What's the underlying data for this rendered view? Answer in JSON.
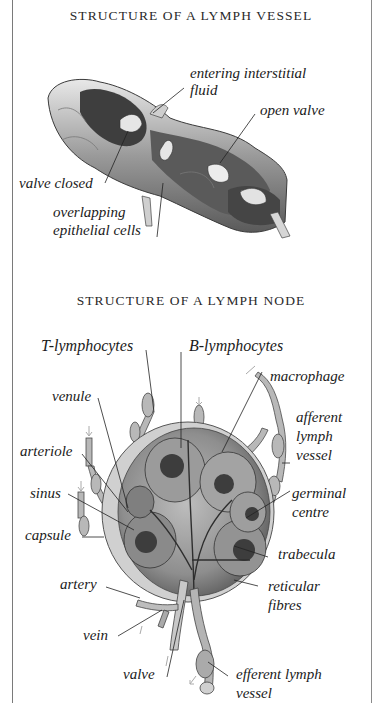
{
  "vessel_section": {
    "title": "STRUCTURE OF A LYMPH VESSEL",
    "labels": {
      "entering_line1": "entering interstitial",
      "entering_line2": "fluid",
      "open_valve": "open valve",
      "valve_closed": "valve closed",
      "overlapping_line1": "overlapping",
      "overlapping_line2": "epithelial cells"
    }
  },
  "node_section": {
    "title": "STRUCTURE OF A LYMPH NODE",
    "labels": {
      "t_lymphocytes": "T-lymphocytes",
      "b_lymphocytes": "B-lymphocytes",
      "macrophage": "macrophage",
      "venule": "venule",
      "afferent_line1": "afferent",
      "afferent_line2": "lymph",
      "afferent_line3": "vessel",
      "arteriole": "arteriole",
      "sinus": "sinus",
      "germinal_line1": "germinal",
      "germinal_line2": "centre",
      "capsule": "capsule",
      "trabecula": "trabecula",
      "artery": "artery",
      "reticular_line1": "reticular",
      "reticular_line2": "fibres",
      "vein": "vein",
      "valve": "valve",
      "efferent_line1": "efferent lymph",
      "efferent_line2": "vessel"
    }
  },
  "colors": {
    "frame": "#7a7a7a",
    "ink": "#1b1b1b",
    "shade_dark": "#4a4a4a",
    "shade_mid": "#8c8c8c",
    "shade_light": "#d4d4d4"
  }
}
